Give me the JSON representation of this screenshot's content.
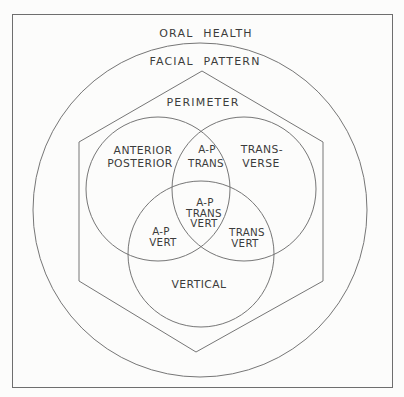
{
  "diagram": {
    "type": "nested-venn",
    "colors": {
      "background": "#fcfcfb",
      "line": "#767676",
      "text": "#3c3c3c"
    },
    "labels": {
      "oral_health": "ORAL HEALTH",
      "facial_pattern": "FACIAL PATTERN",
      "perimeter": "PERIMETER",
      "anterior_posterior": [
        "ANTERIOR",
        "POSTERIOR"
      ],
      "transverse": [
        "TRANS-",
        "VERSE"
      ],
      "vertical": "VERTICAL",
      "ap_trans": [
        "A-P",
        "TRANS"
      ],
      "ap_trans_vert": [
        "A-P",
        "TRANS",
        "VERT"
      ],
      "ap_vert": [
        "A-P",
        "VERT"
      ],
      "trans_vert": [
        "TRANS",
        "VERT"
      ]
    },
    "structure": {
      "ring1_shape": "square",
      "ring2_shape": "circle",
      "ring3_shape": "hexagon",
      "venn_sets": [
        "ANTERIOR POSTERIOR",
        "TRANSVERSE",
        "VERTICAL"
      ]
    }
  }
}
